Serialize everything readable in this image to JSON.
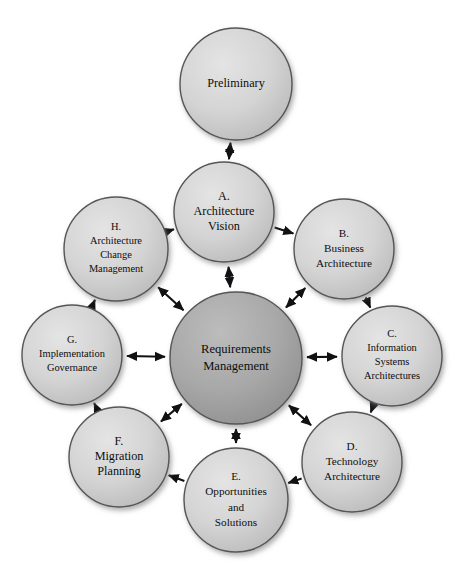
{
  "diagram": {
    "type": "radial-hub-and-spoke",
    "background_color": "#ffffff",
    "node_fill_outer": "#d2d2d2",
    "node_fill_center": "#a8a8a8",
    "node_stroke_color": "#55565a",
    "arrow_color": "#111114",
    "text_color": "#0d0d0d",
    "center": {
      "id": "requirements-management",
      "lines": [
        "Requirements",
        "Management"
      ],
      "cx": 236,
      "cy": 358,
      "r": 66,
      "fill": "#a8a8a8"
    },
    "nodes": [
      {
        "id": "preliminary",
        "lines": [
          "Preliminary"
        ],
        "cx": 236,
        "cy": 84,
        "r": 56,
        "size": "normal"
      },
      {
        "id": "phase-a",
        "lines": [
          "A.",
          "Architecture",
          "Vision"
        ],
        "cx": 224,
        "cy": 212,
        "r": 50,
        "size": "normal"
      },
      {
        "id": "phase-b",
        "lines": [
          "B.",
          "Business",
          "Architecture"
        ],
        "cx": 344,
        "cy": 249,
        "r": 50,
        "size": "small"
      },
      {
        "id": "phase-c",
        "lines": [
          "C.",
          "Information",
          "Systems",
          "Architectures"
        ],
        "cx": 392,
        "cy": 356,
        "r": 50,
        "size": "tiny"
      },
      {
        "id": "phase-d",
        "lines": [
          "D.",
          "Technology",
          "Architecture"
        ],
        "cx": 352,
        "cy": 462,
        "r": 50,
        "size": "small"
      },
      {
        "id": "phase-e",
        "lines": [
          "E.",
          "Opportunities",
          "and",
          "Solutions"
        ],
        "cx": 236,
        "cy": 500,
        "r": 52,
        "size": "small"
      },
      {
        "id": "phase-f",
        "lines": [
          "F.",
          "Migration",
          "Planning"
        ],
        "cx": 119,
        "cy": 457,
        "r": 50,
        "size": "normal"
      },
      {
        "id": "phase-g",
        "lines": [
          "G.",
          "Implementation",
          "Governance"
        ],
        "cx": 72,
        "cy": 355,
        "r": 50,
        "size": "tiny"
      },
      {
        "id": "phase-h",
        "lines": [
          "H.",
          "Architecture",
          "Change",
          "Management"
        ],
        "cx": 116,
        "cy": 249,
        "r": 52,
        "size": "tiny"
      }
    ],
    "spokes": [
      {
        "id": "spoke-a",
        "from": "phase-a",
        "to": "center",
        "heads": "both"
      },
      {
        "id": "spoke-b",
        "from": "phase-b",
        "to": "center",
        "heads": "both"
      },
      {
        "id": "spoke-c",
        "from": "phase-c",
        "to": "center",
        "heads": "both"
      },
      {
        "id": "spoke-d",
        "from": "phase-d",
        "to": "center",
        "heads": "both"
      },
      {
        "id": "spoke-e",
        "from": "phase-e",
        "to": "center",
        "heads": "both"
      },
      {
        "id": "spoke-f",
        "from": "phase-f",
        "to": "center",
        "heads": "both"
      },
      {
        "id": "spoke-g",
        "from": "phase-g",
        "to": "center",
        "heads": "both"
      },
      {
        "id": "spoke-h",
        "from": "phase-h",
        "to": "center",
        "heads": "both"
      }
    ],
    "ring_arrows": [
      {
        "id": "ring-prelim-a",
        "from": "preliminary",
        "to": "phase-a",
        "heads": "both"
      },
      {
        "id": "ring-a-b",
        "from": "phase-a",
        "to": "phase-b",
        "heads": "forward"
      },
      {
        "id": "ring-b-c",
        "from": "phase-b",
        "to": "phase-c",
        "heads": "forward"
      },
      {
        "id": "ring-c-d",
        "from": "phase-c",
        "to": "phase-d",
        "heads": "forward"
      },
      {
        "id": "ring-d-e",
        "from": "phase-d",
        "to": "phase-e",
        "heads": "forward"
      },
      {
        "id": "ring-e-f",
        "from": "phase-e",
        "to": "phase-f",
        "heads": "forward"
      },
      {
        "id": "ring-f-g",
        "from": "phase-f",
        "to": "phase-g",
        "heads": "forward"
      },
      {
        "id": "ring-g-h",
        "from": "phase-g",
        "to": "phase-h",
        "heads": "forward"
      },
      {
        "id": "ring-h-a",
        "from": "phase-h",
        "to": "phase-a",
        "heads": "forward"
      }
    ]
  }
}
